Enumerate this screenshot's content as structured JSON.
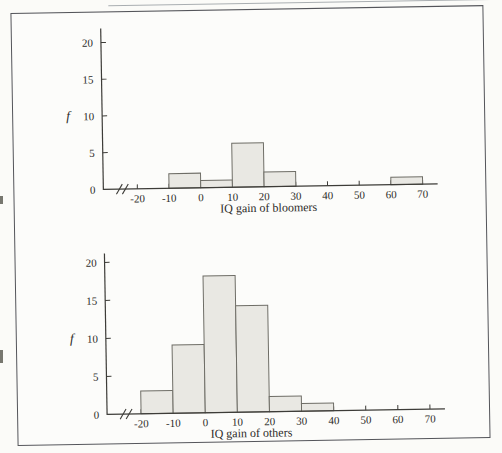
{
  "figure": {
    "frame_border_color": "#54555a",
    "background_color": "#fbfbf8"
  },
  "colors": {
    "bar_fill": "#e9e8e3",
    "bar_stroke": "#6e6d66",
    "axis": "#3d3c38",
    "text": "#2c2b28"
  },
  "chart_data": [
    {
      "type": "bar",
      "title": "",
      "xlabel": "IQ gain of bloomers",
      "ylabel": "f",
      "bin_edges": [
        -20,
        -10,
        0,
        10,
        20,
        30,
        40,
        50,
        60,
        70
      ],
      "frequencies": [
        0,
        2,
        1,
        6,
        2,
        0,
        0,
        0,
        1
      ],
      "x_ticks": [
        -20,
        -10,
        0,
        10,
        20,
        30,
        40,
        50,
        60,
        70
      ],
      "y_ticks": [
        0,
        5,
        10,
        15,
        20
      ],
      "ylim": [
        0,
        20
      ],
      "axis_break_x": true,
      "grid": false,
      "legend": null
    },
    {
      "type": "bar",
      "title": "",
      "xlabel": "IQ gain of others",
      "ylabel": "f",
      "bin_edges": [
        -20,
        -10,
        0,
        10,
        20,
        30,
        40,
        50,
        60,
        70
      ],
      "frequencies": [
        3,
        9,
        18,
        14,
        2,
        1,
        0,
        0,
        0
      ],
      "x_ticks": [
        -20,
        -10,
        0,
        10,
        20,
        30,
        40,
        50,
        60,
        70
      ],
      "y_ticks": [
        0,
        5,
        10,
        15,
        20
      ],
      "ylim": [
        0,
        20
      ],
      "axis_break_x": true,
      "grid": false,
      "legend": null
    }
  ]
}
